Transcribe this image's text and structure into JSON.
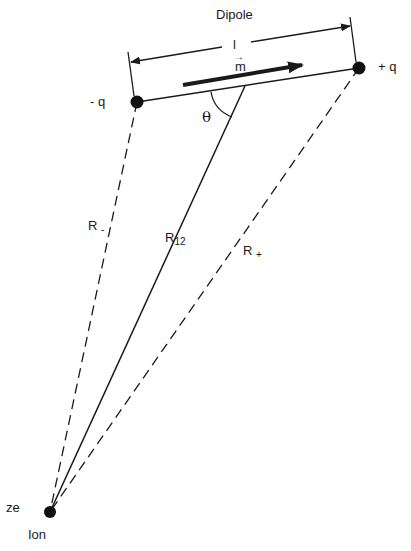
{
  "diagram": {
    "title": "Dipole",
    "colors": {
      "ink": "#1a1a1a",
      "background": "#ffffff"
    },
    "nodes": {
      "neg_charge": {
        "label": "- q",
        "x": 137,
        "y": 102
      },
      "pos_charge": {
        "label": "+ q",
        "x": 359,
        "y": 68
      },
      "ion": {
        "label": "Ion",
        "charge_label": "ze",
        "x": 50,
        "y": 512
      }
    },
    "dimension": {
      "label": "l"
    },
    "moment": {
      "label": "m",
      "vector_mark": "→"
    },
    "angle": {
      "label": "θ"
    },
    "distances": {
      "r_minus": {
        "base": "R",
        "sub": "-"
      },
      "r_12": {
        "base": "R",
        "sub": "12"
      },
      "r_plus": {
        "base": "R",
        "sub": "+"
      }
    }
  }
}
